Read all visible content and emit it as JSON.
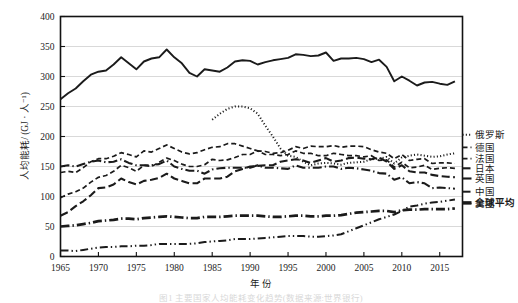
{
  "figure": {
    "caption": "图1  主要国家人均能耗变化趋势(数据来源:世界银行)"
  },
  "chart_data": {
    "type": "line",
    "title": "",
    "xlabel": "年  份",
    "ylabel": "人均能耗/ (GJ · 人⁻¹)",
    "xlim": [
      1965,
      2018
    ],
    "ylim": [
      0,
      400
    ],
    "ytick_labels": [
      "0",
      "50",
      "100",
      "150",
      "200",
      "250",
      "300",
      "350",
      "400"
    ],
    "yticks": [
      0,
      50,
      100,
      150,
      200,
      250,
      300,
      350,
      400
    ],
    "xtick_labels": [
      "1965",
      "1970",
      "1975",
      "1980",
      "1985",
      "1990",
      "1995",
      "2000",
      "2005",
      "2010",
      "2015"
    ],
    "xticks": [
      1965,
      1970,
      1975,
      1980,
      1985,
      1990,
      1995,
      2000,
      2005,
      2010,
      2015
    ],
    "grid": "horizontal",
    "legend_position": "right-outside",
    "series": [
      {
        "name": "美国",
        "style": "solid",
        "label_y": 88,
        "x": [
          1965,
          1966,
          1967,
          1968,
          1969,
          1970,
          1971,
          1972,
          1973,
          1974,
          1975,
          1976,
          1977,
          1978,
          1979,
          1980,
          1981,
          1982,
          1983,
          1984,
          1985,
          1986,
          1987,
          1988,
          1989,
          1990,
          1991,
          1992,
          1993,
          1994,
          1995,
          1996,
          1997,
          1998,
          1999,
          2000,
          2001,
          2002,
          2003,
          2004,
          2005,
          2006,
          2007,
          2008,
          2009,
          2010,
          2011,
          2012,
          2013,
          2014,
          2015,
          2016,
          2017
        ],
        "values": [
          262,
          272,
          280,
          292,
          303,
          308,
          310,
          320,
          332,
          322,
          312,
          325,
          330,
          332,
          345,
          332,
          322,
          306,
          300,
          312,
          310,
          308,
          315,
          325,
          327,
          326,
          320,
          324,
          327,
          329,
          331,
          337,
          336,
          334,
          335,
          340,
          326,
          330,
          330,
          331,
          329,
          324,
          328,
          316,
          292,
          300,
          293,
          285,
          290,
          291,
          288,
          286,
          292
        ]
      },
      {
        "name": "俄罗斯",
        "style": "dotted",
        "label_y": 203,
        "x": [
          1985,
          1986,
          1987,
          1988,
          1989,
          1990,
          1991,
          1992,
          1993,
          1994,
          1995,
          1996,
          1997,
          1998,
          1999,
          2000,
          2001,
          2002,
          2003,
          2004,
          2005,
          2006,
          2007,
          2008,
          2009,
          2010,
          2011,
          2012,
          2013,
          2014,
          2015,
          2016,
          2017
        ],
        "values": [
          228,
          238,
          246,
          250,
          250,
          247,
          238,
          218,
          200,
          180,
          168,
          166,
          158,
          152,
          155,
          156,
          155,
          153,
          156,
          157,
          158,
          162,
          163,
          166,
          155,
          165,
          168,
          170,
          168,
          166,
          167,
          170,
          172
        ]
      },
      {
        "name": "德国",
        "style": "dashed",
        "label_y": 182,
        "x": [
          1965,
          1966,
          1967,
          1968,
          1969,
          1970,
          1971,
          1972,
          1973,
          1974,
          1975,
          1976,
          1977,
          1978,
          1979,
          1980,
          1981,
          1982,
          1983,
          1984,
          1985,
          1986,
          1987,
          1988,
          1989,
          1990,
          1991,
          1992,
          1993,
          1994,
          1995,
          1996,
          1997,
          1998,
          1999,
          2000,
          2001,
          2002,
          2003,
          2004,
          2005,
          2006,
          2007,
          2008,
          2009,
          2010,
          2011,
          2012,
          2013,
          2014,
          2015,
          2016,
          2017
        ],
        "values": [
          140,
          142,
          140,
          148,
          158,
          163,
          163,
          167,
          173,
          170,
          166,
          176,
          174,
          180,
          186,
          180,
          174,
          171,
          173,
          178,
          182,
          183,
          188,
          188,
          184,
          180,
          176,
          170,
          170,
          168,
          170,
          176,
          172,
          172,
          168,
          168,
          172,
          170,
          168,
          168,
          166,
          168,
          160,
          161,
          149,
          157,
          148,
          149,
          152,
          145,
          147,
          148,
          147
        ]
      },
      {
        "name": "法国",
        "style": "dashed",
        "label_y": 163,
        "x": [
          1965,
          1966,
          1967,
          1968,
          1969,
          1970,
          1971,
          1972,
          1973,
          1974,
          1975,
          1976,
          1977,
          1978,
          1979,
          1980,
          1981,
          1982,
          1983,
          1984,
          1985,
          1986,
          1987,
          1988,
          1989,
          1990,
          1991,
          1992,
          1993,
          1994,
          1995,
          1996,
          1997,
          1998,
          1999,
          2000,
          2001,
          2002,
          2003,
          2004,
          2005,
          2006,
          2007,
          2008,
          2009,
          2010,
          2011,
          2012,
          2013,
          2014,
          2015,
          2016,
          2017
        ],
        "values": [
          98,
          104,
          108,
          114,
          124,
          132,
          135,
          142,
          152,
          148,
          142,
          152,
          150,
          157,
          164,
          160,
          154,
          150,
          150,
          153,
          162,
          160,
          161,
          165,
          170,
          170,
          176,
          175,
          172,
          173,
          177,
          183,
          180,
          184,
          183,
          183,
          185,
          182,
          184,
          184,
          183,
          178,
          174,
          172,
          163,
          170,
          160,
          162,
          163,
          155,
          156,
          156,
          155
        ]
      },
      {
        "name": "日本",
        "style": "longdash",
        "label_y": 147,
        "x": [
          1965,
          1966,
          1967,
          1968,
          1969,
          1970,
          1971,
          1972,
          1973,
          1974,
          1975,
          1976,
          1977,
          1978,
          1979,
          1980,
          1981,
          1982,
          1983,
          1984,
          1985,
          1986,
          1987,
          1988,
          1989,
          1990,
          1991,
          1992,
          1993,
          1994,
          1995,
          1996,
          1997,
          1998,
          1999,
          2000,
          2001,
          2002,
          2003,
          2004,
          2005,
          2006,
          2007,
          2008,
          2009,
          2010,
          2011,
          2012,
          2013,
          2014,
          2015,
          2016,
          2017
        ],
        "values": [
          68,
          74,
          84,
          92,
          102,
          114,
          115,
          120,
          130,
          124,
          120,
          126,
          128,
          131,
          138,
          130,
          126,
          122,
          122,
          130,
          130,
          130,
          133,
          142,
          146,
          150,
          151,
          152,
          152,
          158,
          160,
          162,
          160,
          156,
          160,
          164,
          158,
          160,
          164,
          165,
          163,
          162,
          165,
          158,
          146,
          152,
          142,
          140,
          140,
          136,
          134,
          133,
          132
        ]
      },
      {
        "name": "英国",
        "style": "dashdot",
        "label_y": 130,
        "x": [
          1965,
          1966,
          1967,
          1968,
          1969,
          1970,
          1971,
          1972,
          1973,
          1974,
          1975,
          1976,
          1977,
          1978,
          1979,
          1980,
          1981,
          1982,
          1983,
          1984,
          1985,
          1986,
          1987,
          1988,
          1989,
          1990,
          1991,
          1992,
          1993,
          1994,
          1995,
          1996,
          1997,
          1998,
          1999,
          2000,
          2001,
          2002,
          2003,
          2004,
          2005,
          2006,
          2007,
          2008,
          2009,
          2010,
          2011,
          2012,
          2013,
          2014,
          2015,
          2016,
          2017
        ],
        "values": [
          150,
          152,
          150,
          154,
          158,
          160,
          157,
          158,
          162,
          156,
          152,
          152,
          152,
          154,
          160,
          150,
          146,
          143,
          143,
          138,
          145,
          147,
          148,
          148,
          148,
          148,
          152,
          148,
          148,
          147,
          146,
          152,
          148,
          148,
          148,
          150,
          150,
          146,
          148,
          147,
          145,
          143,
          139,
          138,
          128,
          132,
          122,
          124,
          122,
          114,
          115,
          114,
          113
        ]
      },
      {
        "name": "中国",
        "style": "dashdotdot",
        "label_y": 108,
        "x": [
          1965,
          1966,
          1967,
          1968,
          1969,
          1970,
          1971,
          1972,
          1973,
          1974,
          1975,
          1976,
          1977,
          1978,
          1979,
          1980,
          1981,
          1982,
          1983,
          1984,
          1985,
          1986,
          1987,
          1988,
          1989,
          1990,
          1991,
          1992,
          1993,
          1994,
          1995,
          1996,
          1997,
          1998,
          1999,
          2000,
          2001,
          2002,
          2003,
          2004,
          2005,
          2006,
          2007,
          2008,
          2009,
          2010,
          2011,
          2012,
          2013,
          2014,
          2015,
          2016,
          2017
        ],
        "values": [
          10,
          10,
          9,
          11,
          13,
          15,
          16,
          16,
          17,
          17,
          18,
          18,
          19,
          21,
          21,
          21,
          21,
          21,
          22,
          24,
          25,
          26,
          27,
          29,
          29,
          29,
          30,
          31,
          32,
          33,
          34,
          34,
          34,
          33,
          33,
          34,
          35,
          37,
          42,
          47,
          52,
          57,
          62,
          66,
          70,
          76,
          83,
          85,
          88,
          90,
          91,
          93,
          95
        ]
      },
      {
        "name": "全球平均",
        "style": "dashdot-bold",
        "label_y": 90,
        "x": [
          1965,
          1966,
          1967,
          1968,
          1969,
          1970,
          1971,
          1972,
          1973,
          1974,
          1975,
          1976,
          1977,
          1978,
          1979,
          1980,
          1981,
          1982,
          1983,
          1984,
          1985,
          1986,
          1987,
          1988,
          1989,
          1990,
          1991,
          1992,
          1993,
          1994,
          1995,
          1996,
          1997,
          1998,
          1999,
          2000,
          2001,
          2002,
          2003,
          2004,
          2005,
          2006,
          2007,
          2008,
          2009,
          2010,
          2011,
          2012,
          2013,
          2014,
          2015,
          2016,
          2017
        ],
        "values": [
          50,
          51,
          52,
          54,
          56,
          59,
          60,
          61,
          63,
          63,
          62,
          64,
          65,
          66,
          67,
          66,
          65,
          64,
          64,
          66,
          66,
          66,
          67,
          68,
          68,
          68,
          68,
          67,
          66,
          66,
          67,
          68,
          68,
          67,
          67,
          68,
          68,
          69,
          71,
          73,
          74,
          75,
          76,
          76,
          74,
          77,
          78,
          78,
          79,
          79,
          79,
          79,
          80
        ]
      }
    ],
    "legend_order": [
      "美国",
      "俄罗斯",
      "德国",
      "法国",
      "日本",
      "英国",
      "中国",
      "全球平均"
    ]
  }
}
